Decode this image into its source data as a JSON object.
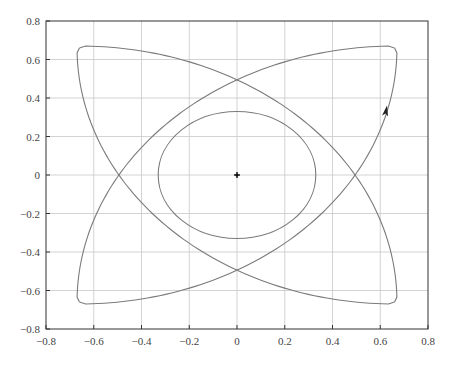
{
  "chart_data": {
    "type": "line",
    "title": "",
    "xlabel": "",
    "ylabel": "",
    "xlim": [
      -0.8,
      0.8
    ],
    "ylim": [
      -0.8,
      0.8
    ],
    "grid": true,
    "legend": null,
    "x_ticks": [
      -0.8,
      -0.6,
      -0.4,
      -0.2,
      0,
      0.2,
      0.4,
      0.6,
      0.8
    ],
    "y_ticks": [
      -0.8,
      -0.6,
      -0.4,
      -0.2,
      0,
      0.2,
      0.4,
      0.6,
      0.8
    ],
    "x_tick_labels": [
      "−0.8",
      "−0.6",
      "−0.4",
      "−0.2",
      "0",
      "0.2",
      "0.4",
      "0.6",
      "0.8"
    ],
    "y_tick_labels": [
      "−0.8",
      "−0.6",
      "−0.4",
      "−0.2",
      "0",
      "0.2",
      "0.4",
      "0.6",
      "0.8"
    ],
    "series": [
      {
        "name": "outer-petal-curve",
        "description": "Four circular arcs, each centered at one corner with radius ~1.33, connecting the adjacent corners",
        "corners": [
          [
            -0.66,
            0.66
          ],
          [
            0.66,
            0.66
          ],
          [
            0.66,
            -0.66
          ],
          [
            -0.66,
            -0.66
          ]
        ],
        "arc_radius": 1.33,
        "crossings": [
          [
            0,
            0.51
          ],
          [
            0.51,
            0
          ],
          [
            0,
            -0.51
          ],
          [
            -0.51,
            0
          ],
          [
            0.25,
            0.25
          ],
          [
            -0.25,
            0.25
          ],
          [
            0.25,
            -0.25
          ],
          [
            -0.25,
            -0.25
          ]
        ]
      },
      {
        "name": "inner-circle",
        "center": [
          0,
          0
        ],
        "radius": 0.33
      }
    ],
    "annotations": [
      {
        "type": "point-marker",
        "x": 0,
        "y": 0,
        "label": "center"
      },
      {
        "type": "direction-arrow",
        "x": 0.62,
        "y": 0.33,
        "direction": "up"
      }
    ],
    "colors": {
      "curve": "#7a7a7a",
      "grid": "#c8c8c8",
      "axes": "#333333",
      "marker": "#111111"
    }
  },
  "layout": {
    "plot_left_px": 46,
    "plot_right_px": 428,
    "plot_top_px": 21,
    "plot_bottom_px": 329
  }
}
